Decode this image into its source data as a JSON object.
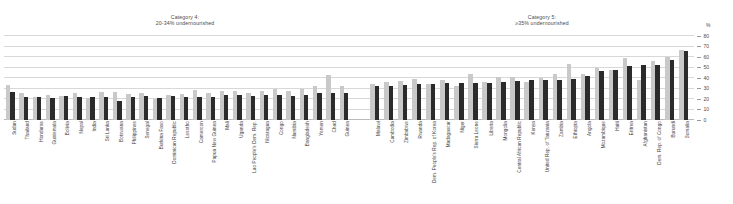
{
  "panels": {
    "cat4": {
      "line1": "Category 4:",
      "line2": "20-34% undernourished"
    },
    "cat5": {
      "line1": "Category 5:",
      "line2": "≥35% undernourished"
    }
  },
  "axis": {
    "unit_label": "%",
    "ticks": [
      "80",
      "70",
      "60",
      "50",
      "40",
      "30",
      "20",
      "10",
      "0"
    ]
  },
  "colors": {
    "light_bar": "#c9c9c9",
    "dark_bar": "#2b2b2b",
    "gridline": "#d8d8d8",
    "text": "#3c3c3c"
  },
  "chart_data": {
    "type": "bar",
    "xlabel": "",
    "ylabel": "%",
    "ylim": [
      0,
      80
    ],
    "grid": true,
    "legend_position": "none",
    "series": [
      {
        "name": "light",
        "color": "#c9c9c9"
      },
      {
        "name": "dark",
        "color": "#2b2b2b"
      }
    ],
    "panels": [
      {
        "name": "Category 4: 20-34% undernourished",
        "categories": [
          "Sudan",
          "Thailand",
          "Honduras",
          "Guatemala",
          "Bolivia",
          "Nepal",
          "India",
          "Sri Lanka",
          "Botswana",
          "Philippines",
          "Senegal",
          "Burkina Faso",
          "Dominican Republic",
          "Lesotho",
          "Cameroon",
          "Papua New Guinea",
          "Mali",
          "Uganda",
          "Lao People's Dem. Rep.",
          "Nicaragua",
          "Congo",
          "Namibia",
          "Bangladesh",
          "Yemen",
          "Chad",
          "Guinea"
        ],
        "light": [
          33,
          26,
          22,
          24,
          23,
          26,
          21,
          27,
          27,
          25,
          26,
          20,
          24,
          25,
          29,
          26,
          28,
          28,
          26,
          28,
          30,
          28,
          30,
          32,
          43,
          32
        ],
        "dark": [
          27,
          22,
          22,
          21,
          23,
          22,
          22,
          22,
          18,
          22,
          23,
          21,
          23,
          22,
          22,
          22,
          24,
          24,
          23,
          24,
          24,
          23,
          24,
          26,
          26,
          26
        ]
      },
      {
        "name": "Category 5: ≥35% undernourished",
        "categories": [
          "Malawi",
          "Cambodia",
          "Zimbabwe",
          "Rwanda",
          "Dem. People's Rep. of Korea",
          "Madagascar",
          "Niger",
          "Sierra Leone",
          "Liberia",
          "Mongolia",
          "Central African Republic",
          "Kenya",
          "United Rep. of Tanzania",
          "Zambia",
          "Ethiopia",
          "Angola",
          "Mozambique",
          "Haiti",
          "Eritrea",
          "Afghanistan",
          "Dem. Rep. of Congo",
          "Burundi",
          "Somalia"
        ],
        "light": [
          34,
          36,
          37,
          39,
          34,
          38,
          32,
          44,
          36,
          41,
          41,
          36,
          40,
          44,
          53,
          44,
          50,
          48,
          59,
          38,
          56,
          60,
          67
        ],
        "dark": [
          32,
          32,
          33,
          34,
          34,
          35,
          35,
          35,
          35,
          36,
          37,
          38,
          38,
          38,
          39,
          42,
          47,
          48,
          51,
          52,
          52,
          57,
          66
        ]
      }
    ]
  }
}
